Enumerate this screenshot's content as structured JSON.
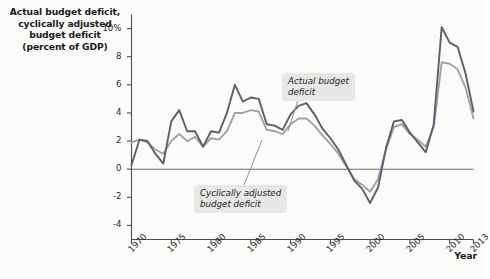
{
  "chart_data": {
    "type": "line",
    "title": "Actual budget deficit,\ncyclically adjusted\nbudget deficit\n(percent of GDP)",
    "xlabel": "Year",
    "ylabel": "",
    "xlim": [
      1970,
      2013
    ],
    "ylim": [
      -5,
      11
    ],
    "grid": false,
    "legend_position": "inline-annotations",
    "y_ticks": [
      "10%",
      "8",
      "6",
      "4",
      "2",
      "0",
      "-2",
      "-4"
    ],
    "y_tick_values": [
      10,
      8,
      6,
      4,
      2,
      0,
      -2,
      -4
    ],
    "x_ticks": [
      "1970",
      "1975",
      "1980",
      "1985",
      "1990",
      "1995",
      "2000",
      "2005",
      "2010",
      "2013"
    ],
    "x_tick_values": [
      1970,
      1975,
      1980,
      1985,
      1990,
      1995,
      2000,
      2005,
      2010,
      2013
    ],
    "x": [
      1970,
      1971,
      1972,
      1973,
      1974,
      1975,
      1976,
      1977,
      1978,
      1979,
      1980,
      1981,
      1982,
      1983,
      1984,
      1985,
      1986,
      1987,
      1988,
      1989,
      1990,
      1991,
      1992,
      1993,
      1994,
      1995,
      1996,
      1997,
      1998,
      1999,
      2000,
      2001,
      2002,
      2003,
      2004,
      2005,
      2006,
      2007,
      2008,
      2009,
      2010,
      2011,
      2012,
      2013
    ],
    "series": [
      {
        "name": "Actual budget deficit",
        "color": "#5a5f6b",
        "values": [
          0.3,
          2.1,
          2.0,
          1.1,
          0.4,
          3.4,
          4.2,
          2.7,
          2.7,
          1.6,
          2.7,
          2.6,
          4.0,
          6.0,
          4.8,
          5.1,
          5.0,
          3.2,
          3.1,
          2.8,
          3.9,
          4.5,
          4.7,
          3.9,
          2.9,
          2.2,
          1.4,
          0.3,
          -0.8,
          -1.4,
          -2.4,
          -1.3,
          1.5,
          3.4,
          3.5,
          2.6,
          1.9,
          1.2,
          3.2,
          10.1,
          9.0,
          8.7,
          6.8,
          4.1
        ]
      },
      {
        "name": "Cyclically adjusted budget deficit",
        "color": "#9ea3a8",
        "values": [
          1.9,
          2.1,
          1.9,
          1.4,
          1.1,
          2.0,
          2.5,
          2.0,
          2.3,
          1.6,
          2.2,
          2.1,
          2.7,
          4.0,
          4.0,
          4.2,
          4.1,
          2.8,
          2.7,
          2.5,
          3.2,
          3.6,
          3.6,
          3.1,
          2.4,
          1.8,
          1.1,
          0.2,
          -0.7,
          -1.1,
          -1.6,
          -0.7,
          1.4,
          3.0,
          3.2,
          2.5,
          2.1,
          1.6,
          3.0,
          7.6,
          7.5,
          7.1,
          5.8,
          3.6
        ]
      }
    ],
    "annotations": [
      {
        "id": "actual",
        "text": "Actual budget\ndeficit"
      },
      {
        "id": "cyclical",
        "text": "Cyclically adjusted\nbudget deficit"
      }
    ]
  },
  "colors": {
    "background": "#fbfbfa",
    "axis": "#4d4d4d",
    "zero_line": "#6b6b6b",
    "callout_bg": "#e7e7e5",
    "text": "#1a1a1a"
  }
}
